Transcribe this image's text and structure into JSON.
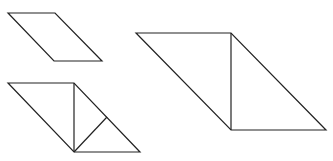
{
  "diagram": {
    "stroke_color": "#222222",
    "background": "#ffffff",
    "shapes": [
      {
        "id": "small-parallelogram",
        "points": [
          [
            8,
            13
          ],
          [
            55,
            13
          ],
          [
            102,
            61
          ],
          [
            54,
            61
          ]
        ],
        "segments": []
      },
      {
        "id": "divided-parallelogram",
        "points": [
          [
            8,
            83
          ],
          [
            74,
            83
          ],
          [
            140,
            152
          ],
          [
            74,
            152
          ]
        ],
        "segments": [
          [
            [
              74,
              83
            ],
            [
              74,
              152
            ]
          ],
          [
            [
              74,
              152
            ],
            [
              107,
              117
            ]
          ]
        ]
      },
      {
        "id": "large-parallelogram",
        "points": [
          [
            136,
            33
          ],
          [
            231,
            33
          ],
          [
            326,
            130
          ],
          [
            231,
            130
          ]
        ],
        "segments": [
          [
            [
              231,
              33
            ],
            [
              231,
              130
            ]
          ]
        ]
      }
    ]
  }
}
